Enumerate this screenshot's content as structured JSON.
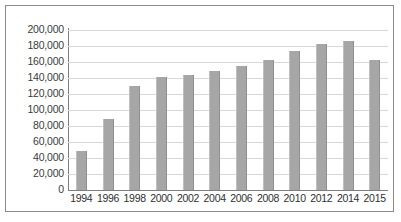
{
  "chart_data": {
    "type": "bar",
    "title": "",
    "subtitle": "",
    "xlabel": "",
    "ylabel": "",
    "categories": [
      "1994",
      "1996",
      "1998",
      "2000",
      "2002",
      "2004",
      "2006",
      "2008",
      "2010",
      "2012",
      "2014",
      "2015"
    ],
    "values": [
      49000,
      89000,
      130000,
      141000,
      144000,
      149000,
      155000,
      163000,
      174000,
      182000,
      186000,
      163000
    ],
    "series": [
      {
        "name": "",
        "values": [
          49000,
          89000,
          130000,
          141000,
          144000,
          149000,
          155000,
          163000,
          174000,
          182000,
          186000,
          163000
        ]
      }
    ],
    "ylim": [
      0,
      200000
    ],
    "ytick_step": 20000,
    "ytick_labels": [
      "200,000",
      "180,000",
      "160,000",
      "140,000",
      "120,000",
      "100,000",
      "80,000",
      "60,000",
      "40,000",
      "20,000",
      "0"
    ],
    "ytick_values": [
      200000,
      180000,
      160000,
      140000,
      120000,
      100000,
      80000,
      60000,
      40000,
      20000,
      0
    ],
    "grid": true,
    "grid_axis": "y",
    "legend": false,
    "legend_position": "none",
    "bar_color": "#a6a6a6",
    "grid_color": "#d9d9d9",
    "axis_color": "#7d7d7d",
    "frame_color": "#8a8a8a",
    "background_color": "#ffffff"
  }
}
